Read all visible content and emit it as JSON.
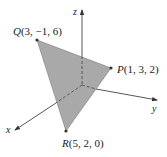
{
  "figure": {
    "type": "3d-coordinate-diagram",
    "axes": {
      "x_label": "x",
      "y_label": "y",
      "z_label": "z"
    },
    "points": [
      {
        "name": "Q",
        "coords": "(3, −1, 6)"
      },
      {
        "name": "P",
        "coords": "(1, 3, 2)"
      },
      {
        "name": "R",
        "coords": "(5, 2, 0)"
      }
    ],
    "triangle": {
      "vertices": [
        "Q",
        "P",
        "R"
      ]
    },
    "colors": {
      "triangle_fill": "#a9a9a9",
      "triangle_edge": "#7a7a7a",
      "axis": "#444444",
      "point": "#333333"
    }
  }
}
